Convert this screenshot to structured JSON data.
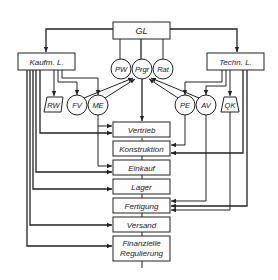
{
  "diagram": {
    "top": {
      "label": "GL"
    },
    "left_head": {
      "label": "Kaufm. L."
    },
    "right_head": {
      "label": "Techn. L."
    },
    "staff": [
      {
        "label": "PW"
      },
      {
        "label": "Prgr"
      },
      {
        "label": "Rat"
      }
    ],
    "left_units": [
      {
        "label": "RW",
        "shape": "trapezoid"
      },
      {
        "label": "FV",
        "shape": "circle"
      },
      {
        "label": "ME",
        "shape": "circle"
      }
    ],
    "right_units": [
      {
        "label": "PE",
        "shape": "circle"
      },
      {
        "label": "AV",
        "shape": "circle"
      },
      {
        "label": "QK",
        "shape": "trapezoid"
      }
    ],
    "functions": [
      {
        "label": "Vertrieb"
      },
      {
        "label": "Konstruktion"
      },
      {
        "label": "Einkauf"
      },
      {
        "label": "Lager"
      },
      {
        "label": "Fertigung"
      },
      {
        "label": "Versand"
      },
      {
        "label": "Finanzielle",
        "label2": "Regulierung"
      }
    ]
  }
}
